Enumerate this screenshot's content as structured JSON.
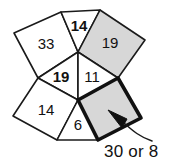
{
  "figure": {
    "type": "geometry-puzzle-diagram",
    "colors": {
      "shaded_fill": "#d7d7d7",
      "plain_fill": "#ffffff",
      "stroke": "#1a1a1a",
      "highlight_stroke": "#111111",
      "background": "#ffffff"
    },
    "cells": [
      {
        "id": "cell-33",
        "label": "33",
        "bold": false,
        "fill": "plain",
        "points": "14,33 61,12 78,52 38,78",
        "label_x": 46,
        "label_y": 45
      },
      {
        "id": "cell-14-top",
        "label": "14",
        "bold": true,
        "fill": "plain",
        "points": "61,12 100,10 78,52",
        "label_x": 79,
        "label_y": 27
      },
      {
        "id": "cell-19-top",
        "label": "19",
        "bold": false,
        "fill": "shaded",
        "points": "100,10 145,40 118,78 78,52",
        "label_x": 110,
        "label_y": 44
      },
      {
        "id": "cell-19-mid",
        "label": "19",
        "bold": true,
        "fill": "plain",
        "points": "38,78 78,52 78,100",
        "label_x": 61,
        "label_y": 78
      },
      {
        "id": "cell-11",
        "label": "11",
        "bold": false,
        "fill": "plain",
        "points": "78,52 118,78 78,100",
        "label_x": 92,
        "label_y": 78
      },
      {
        "id": "cell-14-bottom",
        "label": "14",
        "bold": false,
        "fill": "plain",
        "points": "38,78 78,100 57,140 13,116",
        "label_x": 46,
        "label_y": 111
      },
      {
        "id": "cell-6",
        "label": "6",
        "bold": false,
        "fill": "plain",
        "points": "78,100 98,140 57,140",
        "label_x": 78,
        "label_y": 126
      },
      {
        "id": "cell-target",
        "label": "",
        "bold": false,
        "fill": "highlight",
        "points": "78,100 118,78 141,118 98,140",
        "label_x": 110,
        "label_y": 110
      }
    ],
    "annotation": {
      "label": "30 or 8",
      "leader_path": "M 124,123 C 133,131 140,137 152,141",
      "arrow_points": "127,119 108,110 122,128"
    }
  }
}
